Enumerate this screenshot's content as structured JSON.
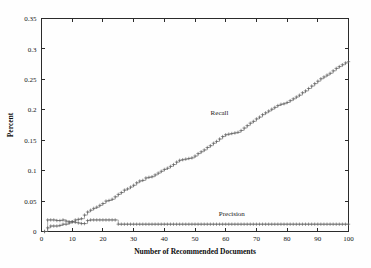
{
  "chart_data": {
    "type": "line",
    "title": "",
    "xlabel": "Number of Recommended Documents",
    "ylabel": "Percent",
    "xlim": [
      0,
      100
    ],
    "ylim": [
      0,
      0.35
    ],
    "grid": false,
    "legend_position": "inline-annotation",
    "marker": "plus",
    "xticks": [
      0,
      10,
      20,
      30,
      40,
      50,
      60,
      70,
      80,
      90,
      100
    ],
    "xticklabels": [
      "0",
      "10",
      "20",
      "30",
      "40",
      "50",
      "60",
      "70",
      "80",
      "90",
      "100"
    ],
    "yticks": [
      0,
      0.05,
      0.1,
      0.15,
      0.2,
      0.25,
      0.3,
      0.35
    ],
    "yticklabels": [
      "0",
      "0.05",
      "0.1",
      "0.15",
      "0.2",
      "0.25",
      "0.3",
      "0.35"
    ],
    "series": [
      {
        "name": "Recall",
        "annotation_label": "Recall",
        "annotation_x": 58,
        "annotation_y": 0.191,
        "color": "#5a5a5a",
        "x": [
          1,
          2,
          3,
          4,
          5,
          6,
          7,
          8,
          9,
          10,
          11,
          12,
          13,
          14,
          15,
          16,
          17,
          18,
          19,
          20,
          21,
          22,
          23,
          24,
          25,
          26,
          27,
          28,
          29,
          30,
          31,
          32,
          33,
          34,
          35,
          36,
          37,
          38,
          39,
          40,
          41,
          42,
          43,
          44,
          45,
          46,
          47,
          48,
          49,
          50,
          51,
          52,
          53,
          54,
          55,
          56,
          57,
          58,
          59,
          60,
          61,
          62,
          63,
          64,
          65,
          66,
          67,
          68,
          69,
          70,
          71,
          72,
          73,
          74,
          75,
          76,
          77,
          78,
          79,
          80,
          81,
          82,
          83,
          84,
          85,
          86,
          87,
          88,
          89,
          90,
          91,
          92,
          93,
          94,
          95,
          96,
          97,
          98,
          99,
          100
        ],
        "values": [
          0.0,
          0.006,
          0.009,
          0.009,
          0.009,
          0.01,
          0.012,
          0.012,
          0.014,
          0.016,
          0.019,
          0.02,
          0.021,
          0.027,
          0.032,
          0.035,
          0.038,
          0.04,
          0.043,
          0.046,
          0.05,
          0.051,
          0.053,
          0.057,
          0.061,
          0.064,
          0.068,
          0.07,
          0.073,
          0.076,
          0.08,
          0.083,
          0.084,
          0.088,
          0.089,
          0.09,
          0.093,
          0.096,
          0.099,
          0.102,
          0.104,
          0.107,
          0.11,
          0.114,
          0.117,
          0.118,
          0.119,
          0.12,
          0.121,
          0.124,
          0.128,
          0.131,
          0.134,
          0.138,
          0.141,
          0.145,
          0.148,
          0.152,
          0.156,
          0.159,
          0.16,
          0.161,
          0.162,
          0.163,
          0.166,
          0.17,
          0.174,
          0.178,
          0.181,
          0.185,
          0.188,
          0.192,
          0.195,
          0.198,
          0.201,
          0.204,
          0.207,
          0.209,
          0.21,
          0.212,
          0.215,
          0.218,
          0.221,
          0.224,
          0.228,
          0.231,
          0.235,
          0.239,
          0.243,
          0.247,
          0.251,
          0.254,
          0.257,
          0.26,
          0.264,
          0.268,
          0.271,
          0.274,
          0.277,
          0.279
        ]
      },
      {
        "name": "Precision",
        "annotation_label": "Precision",
        "annotation_x": 62,
        "annotation_y": 0.0255,
        "color": "#5a5a5a",
        "x": [
          1,
          2,
          3,
          4,
          5,
          6,
          7,
          8,
          9,
          10,
          11,
          12,
          13,
          14,
          15,
          16,
          17,
          18,
          19,
          20,
          21,
          22,
          23,
          24,
          25,
          26,
          27,
          28,
          29,
          30,
          31,
          32,
          33,
          34,
          35,
          36,
          37,
          38,
          39,
          40,
          41,
          42,
          43,
          44,
          45,
          46,
          47,
          48,
          49,
          50,
          51,
          52,
          53,
          54,
          55,
          56,
          57,
          58,
          59,
          60,
          61,
          62,
          63,
          64,
          65,
          66,
          67,
          68,
          69,
          70,
          71,
          72,
          73,
          74,
          75,
          76,
          77,
          78,
          79,
          80,
          81,
          82,
          83,
          84,
          85,
          86,
          87,
          88,
          89,
          90,
          91,
          92,
          93,
          94,
          95,
          96,
          97,
          98,
          99,
          100
        ],
        "values": [
          0.0,
          0.019,
          0.019,
          0.019,
          0.018,
          0.018,
          0.019,
          0.017,
          0.016,
          0.016,
          0.015,
          0.014,
          0.013,
          0.013,
          0.018,
          0.019,
          0.019,
          0.019,
          0.019,
          0.019,
          0.019,
          0.019,
          0.019,
          0.019,
          0.012,
          0.012,
          0.012,
          0.012,
          0.012,
          0.012,
          0.012,
          0.012,
          0.012,
          0.012,
          0.012,
          0.012,
          0.012,
          0.012,
          0.012,
          0.012,
          0.012,
          0.012,
          0.012,
          0.012,
          0.012,
          0.012,
          0.012,
          0.012,
          0.012,
          0.012,
          0.012,
          0.012,
          0.012,
          0.012,
          0.012,
          0.012,
          0.012,
          0.012,
          0.012,
          0.012,
          0.012,
          0.012,
          0.012,
          0.012,
          0.012,
          0.012,
          0.012,
          0.012,
          0.012,
          0.012,
          0.012,
          0.012,
          0.012,
          0.012,
          0.012,
          0.012,
          0.012,
          0.012,
          0.012,
          0.012,
          0.012,
          0.012,
          0.012,
          0.012,
          0.012,
          0.012,
          0.012,
          0.012,
          0.012,
          0.012,
          0.012,
          0.012,
          0.012,
          0.012,
          0.012,
          0.012,
          0.012,
          0.012,
          0.012,
          0.012
        ]
      }
    ]
  }
}
